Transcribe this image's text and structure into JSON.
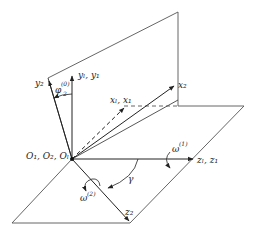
{
  "diagram": {
    "type": "3d-coordinate-frames",
    "colors": {
      "stroke": "#555555",
      "axis": "#222222",
      "background": "#ffffff"
    },
    "labels": {
      "origin": "O₁, O₂, Oₗ",
      "y2": "y₂",
      "yl_y1": "yₗ, y₁",
      "phi": "φ",
      "phi_sup": "(0)",
      "phi_sub": "2",
      "xl_x1": "xₗ, x₁",
      "x2": "x₂",
      "omega1": "ω",
      "omega1_sup": "(1)",
      "zl_z1": "zₗ, z₁",
      "omega2": "ω",
      "omega2_sup": "(2)",
      "gamma": "γ",
      "z2": "z₂"
    }
  }
}
